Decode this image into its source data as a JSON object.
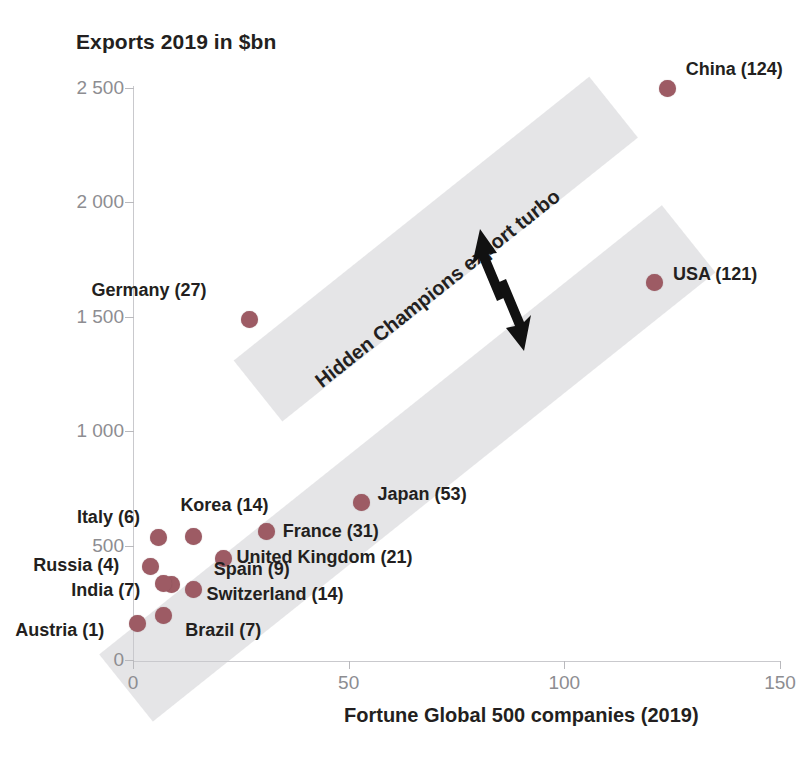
{
  "chart_data": {
    "type": "scatter",
    "title": "Exports 2019 in $bn",
    "xlabel": "Fortune Global 500 companies (2019)",
    "ylabel": "Exports 2019 in $bn",
    "xlim": [
      0,
      150
    ],
    "ylim": [
      0,
      2600
    ],
    "xticks": [
      "0",
      "50",
      "100",
      "150"
    ],
    "xtick_values": [
      0,
      50,
      100,
      150
    ],
    "yticks": [
      "0",
      "500",
      "1 000",
      "1 500",
      "2 000",
      "2 500"
    ],
    "ytick_values": [
      0,
      500,
      1000,
      1500,
      2000,
      2500
    ],
    "grid": false,
    "legend": "none",
    "marker_color": "#9d5b64",
    "band_color": "#e4e4e6",
    "points": [
      {
        "label": "China (124)",
        "name": "China",
        "x": 124,
        "y": 2500,
        "lx": 18,
        "ly": -20
      },
      {
        "label": "USA (121)",
        "name": "USA",
        "x": 121,
        "y": 1650,
        "lx": 18,
        "ly": -9
      },
      {
        "label": "Germany (27)",
        "name": "Germany",
        "x": 27,
        "y": 1490,
        "lx": -158,
        "ly": -30
      },
      {
        "label": "Japan (53)",
        "name": "Japan",
        "x": 53,
        "y": 690,
        "lx": 16,
        "ly": -9
      },
      {
        "label": "France (31)",
        "name": "France",
        "x": 31,
        "y": 560,
        "lx": 16,
        "ly": -2
      },
      {
        "label": "Korea (14)",
        "name": "Korea",
        "x": 14,
        "y": 540,
        "lx": -13,
        "ly": -32
      },
      {
        "label": "Italy (6)",
        "name": "Italy",
        "x": 6,
        "y": 535,
        "lx": -82,
        "ly": -22
      },
      {
        "label": "United Kingdom (21)",
        "name": "United Kingdom",
        "x": 21,
        "y": 445,
        "lx": 13,
        "ly": -2
      },
      {
        "label": "Spain (9)",
        "name": "Spain",
        "x": 9,
        "y": 330,
        "lx": 42,
        "ly": -16
      },
      {
        "label": "Switzerland (14)",
        "name": "Switzerland",
        "x": 14,
        "y": 310,
        "lx": 13,
        "ly": 4
      },
      {
        "label": "India (7)",
        "name": "India",
        "x": 7,
        "y": 335,
        "lx": -92,
        "ly": 6
      },
      {
        "label": "Russia (4)",
        "name": "Russia",
        "x": 4,
        "y": 410,
        "lx": -117,
        "ly": -2
      },
      {
        "label": "Brazil (7)",
        "name": "Brazil",
        "x": 7,
        "y": 195,
        "lx": 22,
        "ly": 14
      },
      {
        "label": "Austria (1)",
        "name": "Austria",
        "x": 1,
        "y": 160,
        "lx": -122,
        "ly": 6
      }
    ],
    "annotations": [
      {
        "text": "Hidden Champions export turbo",
        "rotation": -38.4
      }
    ]
  }
}
